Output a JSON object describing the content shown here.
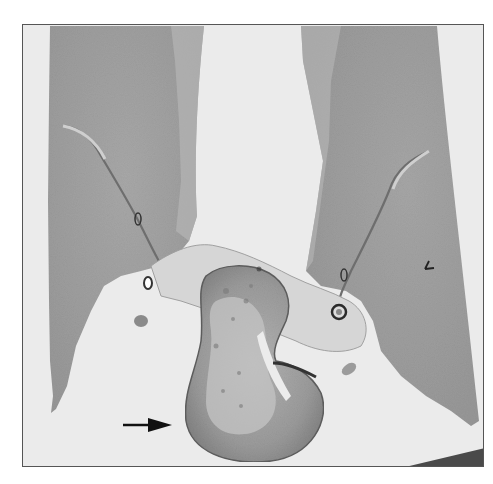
{
  "figure": {
    "type": "histology-micrograph",
    "colormode": "grayscale",
    "background_color": "#e9e9e9",
    "tissue_color": "#9c9c9c",
    "mass_color": "#8e8e8e",
    "annotations": [
      {
        "kind": "arrow",
        "direction": "right",
        "points_to": "central-mass",
        "color": "#111111"
      },
      {
        "kind": "arrowhead-marker",
        "location": "right-lobe",
        "color": "#222222"
      }
    ],
    "regions": [
      "left-lobe",
      "right-lobe",
      "central-mass",
      "septum-left",
      "septum-right",
      "vessel-left",
      "vessel-right"
    ]
  }
}
